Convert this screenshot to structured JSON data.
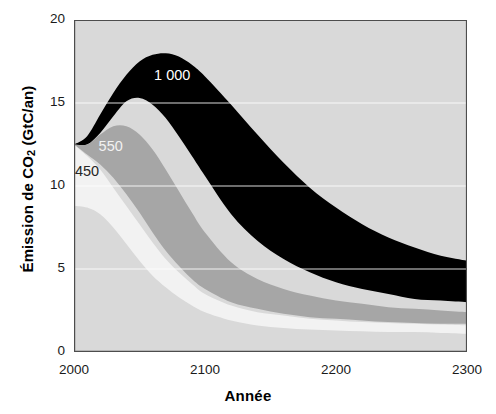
{
  "chart_data": {
    "type": "area",
    "title": "",
    "xlabel": "Année",
    "ylabel": "Émission de CO2 (GtC/an)",
    "ylabel_parts": {
      "pre": "Émission de CO",
      "sub": "2",
      "post": " (GtC/an)"
    },
    "xlim": [
      2000,
      2300
    ],
    "ylim": [
      0,
      20
    ],
    "grid": "horizontal-white-gridlines at 5, 10, 15",
    "legend": "inline band labels",
    "xticks_major": [
      "2000",
      "2100",
      "2200",
      "2300"
    ],
    "xticks_major_values": [
      2000,
      2100,
      2200,
      2300
    ],
    "xtick_minor_step": 20,
    "yticks": [
      "0",
      "5",
      "10",
      "15",
      "20"
    ],
    "ytick_values": [
      0,
      5,
      10,
      15,
      20
    ],
    "ytick_minor_step": 1,
    "background_color": "#d9d9d9",
    "gridline_color": "#ffffff",
    "axis_color": "#4d4d4d",
    "annotations": [
      {
        "label": "1 000",
        "x": 2075,
        "y": 16.4,
        "color": "#ffffff"
      },
      {
        "label": "550",
        "x": 2028,
        "y": 12.1,
        "color": "#f2f2f2"
      },
      {
        "label": "450",
        "x": 2010,
        "y": 10.6,
        "color": "#262626"
      }
    ],
    "series": [
      {
        "name": "1 000",
        "color": "#000000",
        "x": [
          2000,
          2010,
          2020,
          2030,
          2040,
          2050,
          2060,
          2070,
          2080,
          2090,
          2100,
          2120,
          2140,
          2160,
          2180,
          2200,
          2220,
          2240,
          2260,
          2280,
          2300
        ],
        "upper": [
          12.5,
          13.0,
          14.3,
          15.6,
          16.7,
          17.5,
          17.9,
          18.0,
          17.8,
          17.3,
          16.6,
          14.9,
          13.1,
          11.4,
          9.9,
          8.7,
          7.7,
          6.9,
          6.3,
          5.8,
          5.5
        ],
        "lower": [
          12.5,
          12.5,
          13.2,
          14.2,
          15.1,
          15.3,
          14.9,
          14.1,
          13.0,
          11.8,
          10.6,
          8.3,
          6.7,
          5.6,
          4.8,
          4.2,
          3.8,
          3.5,
          3.2,
          3.1,
          3.0
        ]
      },
      {
        "name": "550",
        "color": "#a6a6a6",
        "x": [
          2000,
          2010,
          2020,
          2030,
          2040,
          2050,
          2060,
          2070,
          2080,
          2090,
          2100,
          2120,
          2140,
          2160,
          2180,
          2200,
          2220,
          2240,
          2260,
          2280,
          2300
        ],
        "upper": [
          12.5,
          12.5,
          13.1,
          13.6,
          13.6,
          13.1,
          12.2,
          11.0,
          9.7,
          8.4,
          7.2,
          5.4,
          4.4,
          3.8,
          3.4,
          3.1,
          2.9,
          2.7,
          2.6,
          2.5,
          2.4
        ],
        "lower": [
          12.5,
          11.9,
          11.3,
          10.5,
          9.5,
          8.4,
          7.2,
          6.1,
          5.2,
          4.4,
          3.8,
          3.0,
          2.6,
          2.3,
          2.1,
          2.0,
          1.9,
          1.8,
          1.75,
          1.7,
          1.7
        ]
      },
      {
        "name": "450",
        "color": "#f2f2f2",
        "x": [
          2000,
          2010,
          2020,
          2030,
          2040,
          2050,
          2060,
          2070,
          2080,
          2090,
          2100,
          2120,
          2140,
          2160,
          2180,
          2200,
          2220,
          2240,
          2260,
          2280,
          2300
        ],
        "upper": [
          12.5,
          11.8,
          11.0,
          9.9,
          8.8,
          7.7,
          6.6,
          5.6,
          4.8,
          4.1,
          3.5,
          2.8,
          2.4,
          2.2,
          2.0,
          1.9,
          1.8,
          1.75,
          1.7,
          1.65,
          1.6
        ],
        "lower": [
          8.8,
          8.7,
          8.3,
          7.5,
          6.5,
          5.5,
          4.6,
          3.9,
          3.3,
          2.8,
          2.4,
          1.9,
          1.6,
          1.45,
          1.35,
          1.3,
          1.25,
          1.2,
          1.2,
          1.15,
          1.1
        ]
      }
    ]
  }
}
